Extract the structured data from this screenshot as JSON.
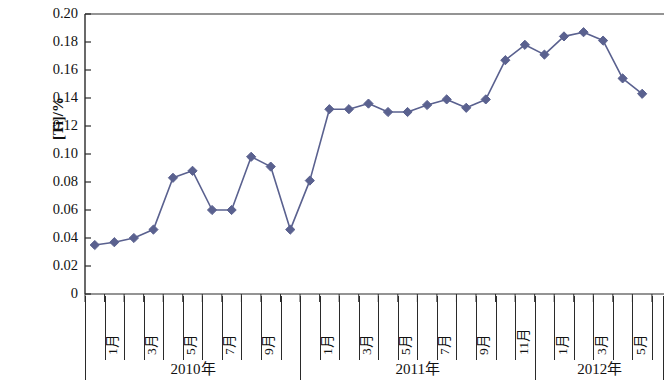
{
  "chart_data": {
    "type": "line",
    "title": "",
    "xlabel": "",
    "ylabel": "[Ti]/%",
    "ylim": [
      0,
      0.2
    ],
    "ytick_labels": [
      "0.20",
      "0.18",
      "0.16",
      "0.14",
      "0.12",
      "0.10",
      "0.08",
      "0.06",
      "0.04",
      "0.02",
      "0"
    ],
    "ytick_values": [
      0.2,
      0.18,
      0.16,
      0.14,
      0.12,
      0.1,
      0.08,
      0.06,
      0.04,
      0.02,
      0
    ],
    "grid": false,
    "legend": null,
    "series_color": "#5a618f",
    "marker": "diamond",
    "x_groups": [
      {
        "label": "2010年",
        "months": 11
      },
      {
        "label": "2011年",
        "months": 12
      },
      {
        "label": "2012年",
        "months": 7
      }
    ],
    "month_tick_labels": [
      "1月",
      "",
      "3月",
      "",
      "5月",
      "",
      "7月",
      "",
      "9月",
      "",
      "",
      "1月",
      "",
      "3月",
      "",
      "5月",
      "",
      "7月",
      "",
      "9月",
      "",
      "11月",
      "",
      "1月",
      "",
      "3月",
      "",
      "5月",
      "",
      ""
    ],
    "categories": [
      "2010-01",
      "2010-02",
      "2010-03",
      "2010-04",
      "2010-05",
      "2010-06",
      "2010-07",
      "2010-08",
      "2010-09",
      "2010-10",
      "2010-11",
      "2011-01",
      "2011-02",
      "2011-03",
      "2011-04",
      "2011-05",
      "2011-06",
      "2011-07",
      "2011-08",
      "2011-09",
      "2011-10",
      "2011-11",
      "2011-12",
      "2012-01",
      "2012-02",
      "2012-03",
      "2012-04",
      "2012-05",
      "2012-06",
      "2012-07"
    ],
    "values": [
      0.035,
      0.037,
      0.04,
      0.046,
      0.083,
      0.088,
      0.06,
      0.06,
      0.098,
      0.091,
      0.046,
      0.081,
      0.132,
      0.132,
      0.136,
      0.13,
      0.13,
      0.135,
      0.139,
      0.133,
      0.139,
      0.167,
      0.178,
      0.171,
      0.184,
      0.187,
      0.181,
      0.154,
      0.143,
      null
    ]
  }
}
